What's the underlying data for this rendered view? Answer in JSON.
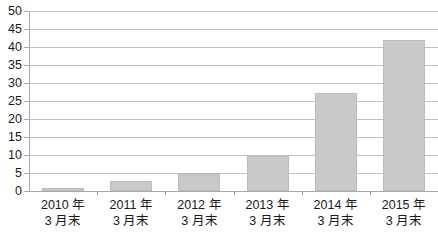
{
  "chart_data": {
    "type": "bar",
    "title": "",
    "subtitle": "",
    "xlabel": "",
    "ylabel": "",
    "categories": [
      "2010 年 3 月末",
      "2011 年 3 月末",
      "2012 年 3 月末",
      "2013 年 3 月末",
      "2014 年 3 月末",
      "2015 年 3 月末"
    ],
    "category_lines": [
      {
        "line1": "2010 年",
        "line2": "3 月末"
      },
      {
        "line1": "2011 年",
        "line2": "3 月末"
      },
      {
        "line1": "2012 年",
        "line2": "3 月末"
      },
      {
        "line1": "2013 年",
        "line2": "3 月末"
      },
      {
        "line1": "2014 年",
        "line2": "3 月末"
      },
      {
        "line1": "2015 年",
        "line2": "3 月末"
      }
    ],
    "values": [
      0.8,
      2.9,
      4.8,
      9.6,
      27.3,
      42.0
    ],
    "ylim": [
      0,
      50
    ],
    "ytick_step": 5,
    "ytick_labels": [
      "50",
      "45",
      "40",
      "35",
      "30",
      "25",
      "20",
      "15",
      "10",
      "5",
      "0"
    ],
    "grid": true,
    "grid_axis": "y",
    "legend": "none",
    "bar_color": "#c9c9c9",
    "bar_edge_color": "#bdbdbd",
    "gridline_color": "#bfbfbf",
    "axis_color": "#a8a8a8",
    "text_color": "#1a1a1a",
    "background": "#ffffff"
  }
}
